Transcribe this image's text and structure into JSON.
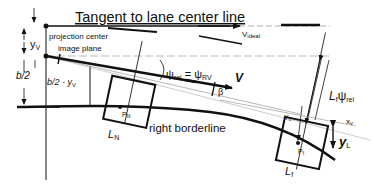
{
  "diagram": {
    "title": "Tangent to lane center line",
    "labels": {
      "v_ideal": "V",
      "v_ideal_sub": "ideal",
      "y_v": "y",
      "y_v_sub": "V",
      "projection_center": "projection center",
      "image_plane": "image plane",
      "b_half": "b/2",
      "b_half_minus": "b/2 - y",
      "b_half_minus_sub": "V",
      "psi_rel": "ψ",
      "psi_rel_sub": "rel",
      "equals": "=",
      "psi_rv": "ψ",
      "psi_rv_sub": "RV",
      "velocity": "V",
      "beta": "β",
      "lf_psi": "L",
      "lf_psi_sub1": "f",
      "lf_psi_psi": "ψ",
      "lf_psi_sub2": "rel",
      "x_v": "x",
      "x_v_sub": "v",
      "y_c": "Y",
      "y_c_sub": "c",
      "y_l": "y",
      "y_l_sub": "L",
      "p_n": "P",
      "p_n_sub": "N",
      "p_f": "P",
      "p_f_sub": "f",
      "l_n": "L",
      "l_n_sub": "N",
      "l_f": "L",
      "l_f_sub": "f",
      "right_borderline": "right borderline"
    },
    "colors": {
      "ink": "#111111",
      "faint": "#888888",
      "background": "#ffffff"
    }
  }
}
